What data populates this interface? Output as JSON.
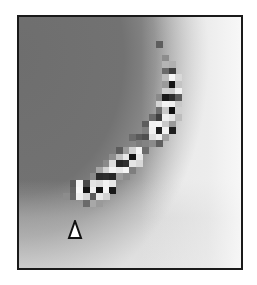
{
  "image": {
    "description": "Grayscale pixel map with a diagonal band of high-contrast cells and a triangle marker",
    "frame": {
      "x": 17,
      "y": 15,
      "width": 226,
      "height": 255,
      "border_color": "#1a1a1a"
    },
    "cell_size": 6.6,
    "colors": {
      "dark_field": "#707070",
      "light_field": "#f2f2f2",
      "black": "#151515",
      "white": "#f8f8f8"
    },
    "cells": [
      {
        "c": 21,
        "r": 4,
        "v": "#5e5e5e"
      },
      {
        "c": 22,
        "r": 6,
        "v": "#8c8c8c"
      },
      {
        "c": 22,
        "r": 7,
        "v": "#b5b5b5"
      },
      {
        "c": 23,
        "r": 7,
        "v": "#b0b0b0"
      },
      {
        "c": 22,
        "r": 8,
        "v": "#6a6a6a"
      },
      {
        "c": 23,
        "r": 8,
        "v": "#3e3e3e"
      },
      {
        "c": 22,
        "r": 9,
        "v": "#bdbdbd"
      },
      {
        "c": 23,
        "r": 9,
        "v": "#f6f6f6"
      },
      {
        "c": 24,
        "r": 9,
        "v": "#d8d8d8"
      },
      {
        "c": 22,
        "r": 10,
        "v": "#9a9a9a"
      },
      {
        "c": 23,
        "r": 10,
        "v": "#161616"
      },
      {
        "c": 24,
        "r": 10,
        "v": "#c4c4c4"
      },
      {
        "c": 22,
        "r": 11,
        "v": "#d0d0d0"
      },
      {
        "c": 23,
        "r": 11,
        "v": "#cdcdcd"
      },
      {
        "c": 24,
        "r": 11,
        "v": "#f2f2f2"
      },
      {
        "c": 21,
        "r": 12,
        "v": "#8a8a8a"
      },
      {
        "c": 22,
        "r": 12,
        "v": "#1a1a1a"
      },
      {
        "c": 23,
        "r": 12,
        "v": "#2e2e2e"
      },
      {
        "c": 24,
        "r": 12,
        "v": "#5a5a5a"
      },
      {
        "c": 21,
        "r": 13,
        "v": "#d5d5d5"
      },
      {
        "c": 22,
        "r": 13,
        "v": "#f4f4f4"
      },
      {
        "c": 23,
        "r": 13,
        "v": "#f0f0f0"
      },
      {
        "c": 24,
        "r": 13,
        "v": "#c8c8c8"
      },
      {
        "c": 21,
        "r": 14,
        "v": "#6f6f6f"
      },
      {
        "c": 22,
        "r": 14,
        "v": "#c9c9c9"
      },
      {
        "c": 23,
        "r": 14,
        "v": "#111111"
      },
      {
        "c": 24,
        "r": 14,
        "v": "#cfcfcf"
      },
      {
        "c": 20,
        "r": 15,
        "v": "#6a6a6a"
      },
      {
        "c": 21,
        "r": 15,
        "v": "#3f3f3f"
      },
      {
        "c": 22,
        "r": 15,
        "v": "#f0f0f0"
      },
      {
        "c": 23,
        "r": 15,
        "v": "#e6e6e6"
      },
      {
        "c": 24,
        "r": 15,
        "v": "#bdbdbd"
      },
      {
        "c": 19,
        "r": 16,
        "v": "#5d5d5d"
      },
      {
        "c": 20,
        "r": 16,
        "v": "#f3f3f3"
      },
      {
        "c": 21,
        "r": 16,
        "v": "#f6f6f6"
      },
      {
        "c": 22,
        "r": 16,
        "v": "#c9c9c9"
      },
      {
        "c": 23,
        "r": 16,
        "v": "#9a9a9a"
      },
      {
        "c": 19,
        "r": 17,
        "v": "#7e7e7e"
      },
      {
        "c": 20,
        "r": 17,
        "v": "#f1f1f1"
      },
      {
        "c": 21,
        "r": 17,
        "v": "#1f1f1f"
      },
      {
        "c": 22,
        "r": 17,
        "v": "#f2f2f2"
      },
      {
        "c": 23,
        "r": 17,
        "v": "#1e1e1e"
      },
      {
        "c": 17,
        "r": 18,
        "v": "#6b6b6b"
      },
      {
        "c": 18,
        "r": 18,
        "v": "#5a5a5a"
      },
      {
        "c": 19,
        "r": 18,
        "v": "#4f4f4f"
      },
      {
        "c": 20,
        "r": 18,
        "v": "#dedede"
      },
      {
        "c": 21,
        "r": 18,
        "v": "#f0f0f0"
      },
      {
        "c": 22,
        "r": 18,
        "v": "#a0a0a0"
      },
      {
        "c": 18,
        "r": 19,
        "v": "#7c7c7c"
      },
      {
        "c": 19,
        "r": 19,
        "v": "#838383"
      },
      {
        "c": 20,
        "r": 19,
        "v": "#8b8b8b"
      },
      {
        "c": 21,
        "r": 19,
        "v": "#5f5f5f"
      },
      {
        "c": 15,
        "r": 20,
        "v": "#5c5c5c"
      },
      {
        "c": 16,
        "r": 20,
        "v": "#9c9c9c"
      },
      {
        "c": 17,
        "r": 20,
        "v": "#d0d0d0"
      },
      {
        "c": 18,
        "r": 20,
        "v": "#f3f3f3"
      },
      {
        "c": 19,
        "r": 20,
        "v": "#6b6b6b"
      },
      {
        "c": 14,
        "r": 21,
        "v": "#8e8e8e"
      },
      {
        "c": 15,
        "r": 21,
        "v": "#c2c2c2"
      },
      {
        "c": 16,
        "r": 21,
        "v": "#e8e8e8"
      },
      {
        "c": 17,
        "r": 21,
        "v": "#141414"
      },
      {
        "c": 18,
        "r": 21,
        "v": "#e7e7e7"
      },
      {
        "c": 13,
        "r": 22,
        "v": "#8a8a8a"
      },
      {
        "c": 14,
        "r": 22,
        "v": "#dcdcdc"
      },
      {
        "c": 15,
        "r": 22,
        "v": "#262626"
      },
      {
        "c": 16,
        "r": 22,
        "v": "#303030"
      },
      {
        "c": 17,
        "r": 22,
        "v": "#e4e4e4"
      },
      {
        "c": 18,
        "r": 22,
        "v": "#d8d8d8"
      },
      {
        "c": 12,
        "r": 23,
        "v": "#a6a6a6"
      },
      {
        "c": 13,
        "r": 23,
        "v": "#d3d3d3"
      },
      {
        "c": 14,
        "r": 23,
        "v": "#f1f1f1"
      },
      {
        "c": 15,
        "r": 23,
        "v": "#e8e8e8"
      },
      {
        "c": 16,
        "r": 23,
        "v": "#f4f4f4"
      },
      {
        "c": 17,
        "r": 23,
        "v": "#7e7e7e"
      },
      {
        "c": 11,
        "r": 24,
        "v": "#8a8a8a"
      },
      {
        "c": 12,
        "r": 24,
        "v": "#2a2a2a"
      },
      {
        "c": 13,
        "r": 24,
        "v": "#2e2e2e"
      },
      {
        "c": 14,
        "r": 24,
        "v": "#262626"
      },
      {
        "c": 15,
        "r": 24,
        "v": "#9a9a9a"
      },
      {
        "c": 16,
        "r": 24,
        "v": "#8c8c8c"
      },
      {
        "c": 8,
        "r": 25,
        "v": "#5a5a5a"
      },
      {
        "c": 9,
        "r": 25,
        "v": "#f2f2f2"
      },
      {
        "c": 10,
        "r": 25,
        "v": "#4a4a4a"
      },
      {
        "c": 11,
        "r": 25,
        "v": "#e4e4e4"
      },
      {
        "c": 12,
        "r": 25,
        "v": "#dcdcdc"
      },
      {
        "c": 13,
        "r": 25,
        "v": "#f2f2f2"
      },
      {
        "c": 14,
        "r": 25,
        "v": "#e8e8e8"
      },
      {
        "c": 8,
        "r": 26,
        "v": "#626262"
      },
      {
        "c": 9,
        "r": 26,
        "v": "#f6f6f6"
      },
      {
        "c": 10,
        "r": 26,
        "v": "#141414"
      },
      {
        "c": 11,
        "r": 26,
        "v": "#f0f0f0"
      },
      {
        "c": 12,
        "r": 26,
        "v": "#141414"
      },
      {
        "c": 13,
        "r": 26,
        "v": "#f4f4f4"
      },
      {
        "c": 14,
        "r": 26,
        "v": "#1a1a1a"
      },
      {
        "c": 7,
        "r": 27,
        "v": "#8c8c8c"
      },
      {
        "c": 8,
        "r": 27,
        "v": "#666666"
      },
      {
        "c": 9,
        "r": 27,
        "v": "#eeeeee"
      },
      {
        "c": 10,
        "r": 27,
        "v": "#d6d6d6"
      },
      {
        "c": 11,
        "r": 27,
        "v": "#5a5a5a"
      },
      {
        "c": 12,
        "r": 27,
        "v": "#e8e8e8"
      },
      {
        "c": 13,
        "r": 27,
        "v": "#d2d2d2"
      },
      {
        "c": 10,
        "r": 28,
        "v": "#6a6a6a"
      },
      {
        "c": 11,
        "r": 28,
        "v": "#a8a8a8"
      },
      {
        "c": 12,
        "r": 28,
        "v": "#9a9a9a"
      }
    ],
    "marker": {
      "shape": "triangle-up",
      "x": 73,
      "y": 228,
      "fill": "#ffffff",
      "stroke": "#111111"
    }
  }
}
